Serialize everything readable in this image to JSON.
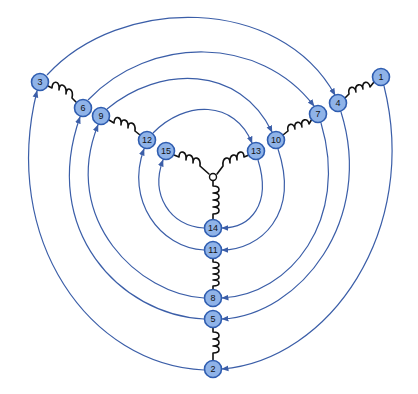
{
  "diagram": {
    "type": "three-arm spring network with circulating arrows",
    "colors": {
      "arc": "#3b5ea8",
      "node_fill": "#8fb3e8",
      "node_stroke": "#2f5db0",
      "spring": "#111111",
      "background": "#ffffff"
    },
    "center": {
      "x": 213,
      "y": 177
    },
    "nodes": [
      {
        "id": "1",
        "label": "1",
        "x": 381,
        "y": 77
      },
      {
        "id": "2",
        "label": "2",
        "x": 213,
        "y": 369
      },
      {
        "id": "3",
        "label": "3",
        "x": 40,
        "y": 82
      },
      {
        "id": "4",
        "label": "4",
        "x": 338,
        "y": 103
      },
      {
        "id": "5",
        "label": "5",
        "x": 213,
        "y": 319
      },
      {
        "id": "6",
        "label": "6",
        "x": 83,
        "y": 108
      },
      {
        "id": "7",
        "label": "7",
        "x": 318,
        "y": 114
      },
      {
        "id": "8",
        "label": "8",
        "x": 213,
        "y": 298
      },
      {
        "id": "9",
        "label": "9",
        "x": 101,
        "y": 116
      },
      {
        "id": "10",
        "label": "10",
        "x": 276,
        "y": 140
      },
      {
        "id": "11",
        "label": "11",
        "x": 213,
        "y": 250
      },
      {
        "id": "12",
        "label": "12",
        "x": 147,
        "y": 140
      },
      {
        "id": "13",
        "label": "13",
        "x": 256,
        "y": 151
      },
      {
        "id": "14",
        "label": "14",
        "x": 213,
        "y": 228
      },
      {
        "id": "15",
        "label": "15",
        "x": 166,
        "y": 151
      }
    ],
    "springs": [
      {
        "from": "3",
        "to": "6"
      },
      {
        "from": "9",
        "to": "12"
      },
      {
        "from": "15",
        "to": "center"
      },
      {
        "from": "4",
        "to": "1"
      },
      {
        "from": "10",
        "to": "7"
      },
      {
        "from": "13",
        "to": "center"
      },
      {
        "from": "center",
        "to": "14"
      },
      {
        "from": "11",
        "to": "8"
      },
      {
        "from": "5",
        "to": "2"
      }
    ],
    "arrows": [
      {
        "from": "3",
        "to": "4"
      },
      {
        "from": "1",
        "to": "2"
      },
      {
        "from": "2",
        "to": "3"
      },
      {
        "from": "6",
        "to": "7"
      },
      {
        "from": "4",
        "to": "5"
      },
      {
        "from": "5",
        "to": "6"
      },
      {
        "from": "9",
        "to": "10"
      },
      {
        "from": "7",
        "to": "8"
      },
      {
        "from": "8",
        "to": "9"
      },
      {
        "from": "12",
        "to": "13"
      },
      {
        "from": "10",
        "to": "11"
      },
      {
        "from": "11",
        "to": "12"
      },
      {
        "from": "15",
        "to": "13"
      },
      {
        "from": "13",
        "to": "14"
      },
      {
        "from": "14",
        "to": "15"
      }
    ]
  }
}
